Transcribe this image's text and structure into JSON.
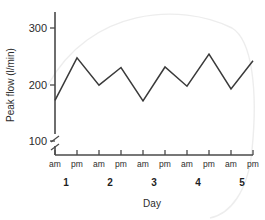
{
  "chart_data": {
    "type": "line",
    "title": "",
    "xlabel": "Day",
    "ylabel": "Peak flow (l/min)",
    "x": [
      "am",
      "pm",
      "am",
      "pm",
      "am",
      "pm",
      "am",
      "pm",
      "am",
      "pm"
    ],
    "categories": [
      "am",
      "pm",
      "am",
      "pm",
      "am",
      "pm",
      "am",
      "pm",
      "am",
      "pm"
    ],
    "values": [
      172,
      247,
      199,
      230,
      171,
      231,
      197,
      254,
      192,
      242
    ],
    "series": [
      {
        "name": "Peak flow",
        "values": [
          172,
          247,
          199,
          230,
          171,
          231,
          197,
          254,
          192,
          242
        ]
      }
    ],
    "day_groups": [
      "1",
      "2",
      "3",
      "4",
      "5"
    ],
    "ylim": [
      140,
      320
    ],
    "yticks": [
      100,
      200,
      300
    ],
    "ytick_labels": [
      "100",
      "200",
      "300"
    ],
    "y_axis_break": true,
    "grid": false,
    "legend": false,
    "line_color": "#3a3a3a",
    "axis_color": "#4a4a4a"
  },
  "axes": {
    "y_title": "Peak flow (l/min)",
    "x_title": "Day",
    "y_ticks": [
      {
        "label": "300",
        "value": 300
      },
      {
        "label": "200",
        "value": 200
      },
      {
        "label": "100",
        "value": 100
      }
    ],
    "x_ticks": [
      {
        "label": "am"
      },
      {
        "label": "pm"
      },
      {
        "label": "am"
      },
      {
        "label": "pm"
      },
      {
        "label": "am"
      },
      {
        "label": "pm"
      },
      {
        "label": "am"
      },
      {
        "label": "pm"
      },
      {
        "label": "am"
      },
      {
        "label": "pm"
      }
    ],
    "day_labels": [
      {
        "label": "1"
      },
      {
        "label": "2"
      },
      {
        "label": "3"
      },
      {
        "label": "4"
      },
      {
        "label": "5"
      }
    ]
  }
}
